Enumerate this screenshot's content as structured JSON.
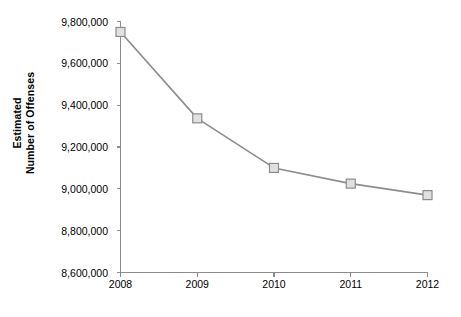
{
  "chart_data": {
    "type": "line",
    "title": "",
    "xlabel": "",
    "ylabel": "Estimated Number of Offenses",
    "ylabel_line1": "Estimated",
    "ylabel_line2": "Number of Offenses",
    "categories": [
      "2008",
      "2009",
      "2010",
      "2011",
      "2012"
    ],
    "values": [
      9750000,
      9337000,
      9100000,
      9025000,
      8970000
    ],
    "series": [
      {
        "name": "Estimated Number of Offenses",
        "values": [
          9750000,
          9337000,
          9100000,
          9025000,
          8970000
        ]
      }
    ],
    "ylim": [
      8600000,
      9800000
    ],
    "ytick_values": [
      8600000,
      8800000,
      9000000,
      9200000,
      9400000,
      9600000,
      9800000
    ],
    "ytick_labels": [
      "8,600,000",
      "8,800,000",
      "9,000,000",
      "9,200,000",
      "9,400,000",
      "9,600,000",
      "9,800,000"
    ],
    "xtick_labels": [
      "2008",
      "2009",
      "2010",
      "2011",
      "2012"
    ],
    "grid": false,
    "legend": "none",
    "colors": {
      "line": "#8c8c8c",
      "marker_fill": "#e0e0e0",
      "marker_stroke": "#8c8c8c",
      "axis": "#8c8c8c",
      "text": "#000000",
      "background": "#ffffff"
    }
  }
}
